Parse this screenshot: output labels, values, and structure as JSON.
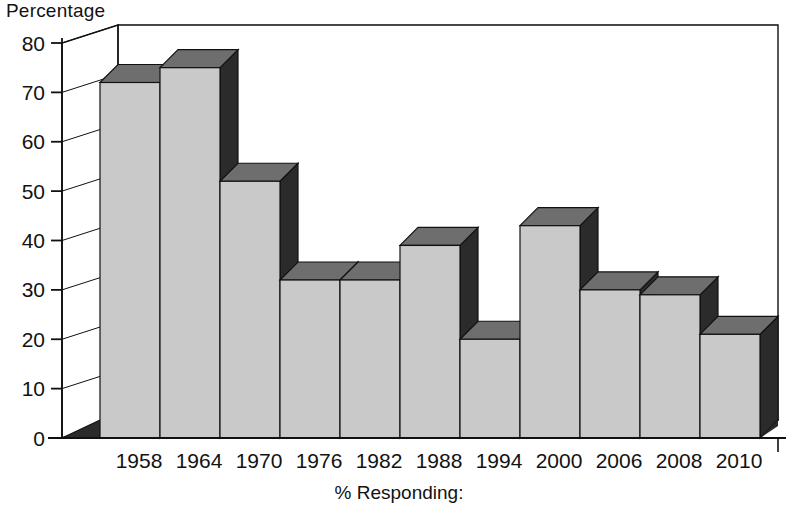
{
  "chart_data": {
    "type": "bar",
    "title": "",
    "ylabel": "Percentage",
    "xlabel": "% Responding:",
    "categories": [
      "1958",
      "1964",
      "1970",
      "1976",
      "1982",
      "1988",
      "1994",
      "2000",
      "2006",
      "2008",
      "2010"
    ],
    "values": [
      72,
      75,
      52,
      32,
      32,
      39,
      20,
      43,
      30,
      29,
      21
    ],
    "ylim": [
      0,
      80
    ],
    "ytick_labels": [
      "0",
      "10",
      "20",
      "30",
      "40",
      "50",
      "60",
      "70",
      "80"
    ],
    "ytick_values": [
      0,
      10,
      20,
      30,
      40,
      50,
      60,
      70,
      80
    ],
    "grid": true,
    "legend": "none",
    "style": "3d-column",
    "colors": {
      "bar_face": "#c9c9c9",
      "bar_top": "#6e6e6e",
      "bar_side": "#2b2b2b",
      "outline": "#111111",
      "gridline": "#9a9a9a",
      "background": "#ffffff",
      "text": "#121212"
    }
  }
}
